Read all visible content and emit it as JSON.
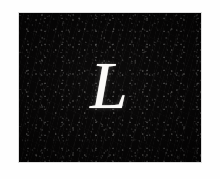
{
  "image": {
    "kind": "photographic-plate",
    "subject_letter": "L",
    "letter_style": "italic-serif-capital",
    "letter_color": "#fbfaf8",
    "background_color": "#050404",
    "page_color": "#ffffff",
    "plate": {
      "x": 19,
      "y": 13,
      "width": 182,
      "height": 149
    },
    "canvas": {
      "width": 220,
      "height": 179
    },
    "texture": "grainy-noise",
    "alt_text": "White italic serif capital letter L on a dark grainy background"
  }
}
